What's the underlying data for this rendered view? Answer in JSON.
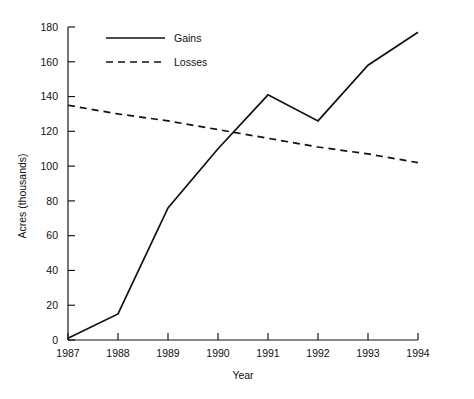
{
  "chart_data": {
    "type": "line",
    "title": "",
    "xlabel": "Year",
    "ylabel": "Acres (thousands)",
    "x": [
      1987,
      1988,
      1989,
      1990,
      1991,
      1992,
      1993,
      1994
    ],
    "xtick_labels": [
      "1987",
      "1988",
      "1989",
      "1990",
      "1991",
      "1992",
      "1993",
      "1994"
    ],
    "ytick_labels": [
      "0",
      "20",
      "40",
      "60",
      "80",
      "100",
      "120",
      "140",
      "160",
      "180"
    ],
    "yticks": [
      0,
      20,
      40,
      60,
      80,
      100,
      120,
      140,
      160,
      180
    ],
    "ylim": [
      0,
      180
    ],
    "xlim": [
      1987,
      1994
    ],
    "grid": false,
    "legend_position": "top-left-inset",
    "series": [
      {
        "name": "Gains",
        "style": "solid",
        "color": "#111111",
        "values": [
          1,
          15,
          76,
          110,
          141,
          126,
          158,
          177
        ]
      },
      {
        "name": "Losses",
        "style": "dashed",
        "color": "#111111",
        "values": [
          135,
          130,
          126,
          121,
          116,
          111,
          107,
          102
        ]
      }
    ]
  },
  "legend": {
    "items": [
      {
        "label": "Gains",
        "style": "solid"
      },
      {
        "label": "Losses",
        "style": "dashed"
      }
    ]
  },
  "axes": {
    "x_title": "Year",
    "y_title": "Acres (thousands)"
  }
}
